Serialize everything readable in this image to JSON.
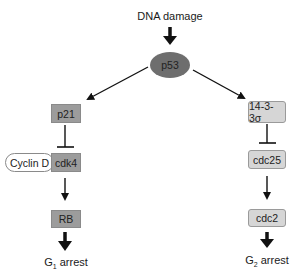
{
  "diagram": {
    "title_input": "DNA damage",
    "nodes": {
      "p53": "p53",
      "p21": "p21",
      "cyclin_d": "Cyclin D",
      "cdk4": "cdk4",
      "rb": "RB",
      "sigma": "14-3-3σ",
      "cdc25": "cdc25",
      "cdc2": "cdc2"
    },
    "outcomes": {
      "g1_prefix": "G",
      "g1_sub": "1",
      "g1_suffix": " arrest",
      "g2_prefix": "G",
      "g2_sub": "2",
      "g2_suffix": " arrest"
    },
    "edges": [
      {
        "from": "DNA damage",
        "to": "p53",
        "type": "activation"
      },
      {
        "from": "p53",
        "to": "p21",
        "type": "activation"
      },
      {
        "from": "p53",
        "to": "14-3-3σ",
        "type": "activation"
      },
      {
        "from": "p21",
        "to": "cdk4",
        "type": "inhibition"
      },
      {
        "from": "cdk4",
        "to": "RB",
        "type": "activation"
      },
      {
        "from": "RB",
        "to": "G1 arrest",
        "type": "activation"
      },
      {
        "from": "14-3-3σ",
        "to": "cdc25",
        "type": "inhibition"
      },
      {
        "from": "cdc25",
        "to": "cdc2",
        "type": "activation"
      },
      {
        "from": "cdc2",
        "to": "G2 arrest",
        "type": "activation"
      }
    ],
    "colors": {
      "p53_fill": "#6e6e6e",
      "left_box_fill": "#9c9c9c",
      "right_box_fill": "#d6d6d6",
      "line": "#111111"
    }
  }
}
